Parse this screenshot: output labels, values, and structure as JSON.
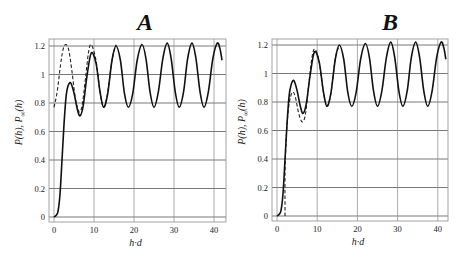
{
  "chart_data": [
    {
      "type": "line",
      "title": "A",
      "xlabel": "h·d",
      "ylabel": "P(h), P∞(h)",
      "ylabel_parts": {
        "p1": "P",
        "s1": "",
        "arg1": "(h)",
        "sep": ",  ",
        "p2": "P",
        "s2": "∞",
        "arg2": "(h)"
      },
      "xlim": [
        -1.2,
        43
      ],
      "ylim": [
        -0.035,
        1.25
      ],
      "xticks": [
        0,
        10,
        20,
        30,
        40
      ],
      "xtick_labels": [
        "0",
        "10",
        "20",
        "30",
        "40"
      ],
      "yticks": [
        0,
        0.2,
        0.4,
        0.6,
        0.8,
        1,
        1.2
      ],
      "ytick_labels": [
        "0",
        "0.2",
        "0.4",
        "0.6",
        "0.8",
        "1",
        "1.2"
      ],
      "grid": true,
      "series": [
        {
          "name": "P(h)",
          "style": "solid",
          "x": [
            0,
            0.5,
            1,
            1.5,
            2,
            2.5,
            3,
            3.5,
            4.2,
            5,
            5.8,
            6.5,
            7.3,
            8.2,
            9.3,
            10.5,
            11.5,
            12.4,
            13.4,
            14.5,
            15.5,
            16.6,
            17.6,
            18.6,
            19.7,
            20.8,
            22,
            23,
            24,
            25,
            26.1,
            27.2,
            28.3,
            29.3,
            30.3,
            31.3,
            32.4,
            33.4,
            34.5,
            35.5,
            36.5,
            37.5,
            38.6,
            39.7,
            40.8,
            41.5,
            42
          ],
          "y": [
            0,
            0.01,
            0.04,
            0.16,
            0.4,
            0.65,
            0.84,
            0.92,
            0.94,
            0.87,
            0.76,
            0.71,
            0.78,
            0.98,
            1.15,
            1.08,
            0.88,
            0.77,
            0.86,
            1.1,
            1.2,
            1.1,
            0.87,
            0.77,
            0.87,
            1.1,
            1.21,
            1.11,
            0.88,
            0.77,
            0.88,
            1.11,
            1.22,
            1.11,
            0.88,
            0.77,
            0.88,
            1.11,
            1.22,
            1.11,
            0.88,
            0.77,
            0.88,
            1.11,
            1.22,
            1.18,
            1.1
          ]
        },
        {
          "name": "P∞(h)",
          "style": "dashed",
          "x": [
            0,
            0.8,
            1.6,
            2.3,
            3,
            3.7,
            4.5,
            5.3,
            6.2,
            7,
            7.9,
            8.6,
            9.3,
            10.5,
            11.5,
            12.4,
            13.4,
            14.5,
            15.5
          ],
          "y": [
            0.77,
            0.88,
            1.06,
            1.18,
            1.21,
            1.17,
            1.02,
            0.84,
            0.74,
            0.78,
            0.98,
            1.15,
            1.21,
            1.1,
            0.88,
            0.77,
            0.87,
            1.1,
            1.21
          ]
        }
      ]
    },
    {
      "type": "line",
      "title": "B",
      "xlabel": "h·d",
      "ylabel": "P(h), P∞(h)",
      "ylabel_parts": {
        "p1": "P",
        "s1": "",
        "arg1": "(h)",
        "sep": ",  ",
        "p2": "P",
        "s2": "∞",
        "arg2": "(h)"
      },
      "xlim": [
        -1.2,
        43
      ],
      "ylim": [
        -0.035,
        1.25
      ],
      "xticks": [
        0,
        10,
        20,
        30,
        40
      ],
      "xtick_labels": [
        "0",
        "10",
        "20",
        "30",
        "40"
      ],
      "yticks": [
        0,
        0.2,
        0.4,
        0.6,
        0.8,
        1,
        1.2
      ],
      "ytick_labels": [
        "0",
        "0.2",
        "0.4",
        "0.6",
        "0.8",
        "1",
        "1.2"
      ],
      "grid": true,
      "series": [
        {
          "name": "P(h)",
          "style": "solid",
          "x": [
            0,
            0.5,
            1,
            1.5,
            2,
            2.5,
            3,
            3.5,
            4.2,
            5,
            5.8,
            6.5,
            7.3,
            8.2,
            9.3,
            10.5,
            11.5,
            12.4,
            13.4,
            14.5,
            15.5,
            16.6,
            17.6,
            18.6,
            19.7,
            20.8,
            22,
            23,
            24,
            25,
            26.1,
            27.2,
            28.3,
            29.3,
            30.3,
            31.3,
            32.4,
            33.4,
            34.5,
            35.5,
            36.5,
            37.5,
            38.6,
            39.7,
            40.8,
            41.5,
            42
          ],
          "y": [
            0,
            0.01,
            0.04,
            0.16,
            0.4,
            0.65,
            0.84,
            0.92,
            0.95,
            0.88,
            0.77,
            0.72,
            0.79,
            0.98,
            1.15,
            1.08,
            0.88,
            0.77,
            0.86,
            1.1,
            1.2,
            1.1,
            0.87,
            0.77,
            0.87,
            1.1,
            1.21,
            1.11,
            0.88,
            0.77,
            0.88,
            1.11,
            1.22,
            1.11,
            0.88,
            0.77,
            0.88,
            1.11,
            1.22,
            1.11,
            0.88,
            0.77,
            0.88,
            1.11,
            1.22,
            1.18,
            1.1
          ]
        },
        {
          "name": "P∞(h)",
          "style": "dashed",
          "x": [
            2.0,
            2.0,
            2.3,
            2.8,
            3.4,
            4.0,
            4.6,
            5.4,
            6.3,
            7.1,
            8.0,
            8.8,
            9.5,
            10.5,
            11.5,
            12.4,
            13.4,
            14.5,
            15.5
          ],
          "y": [
            0,
            0.3,
            0.55,
            0.74,
            0.84,
            0.87,
            0.83,
            0.72,
            0.66,
            0.72,
            0.95,
            1.13,
            1.17,
            1.08,
            0.88,
            0.77,
            0.86,
            1.1,
            1.2
          ]
        }
      ]
    }
  ],
  "layout": {
    "panels": [
      {
        "left": 49,
        "right": 226,
        "top": 39,
        "bottom": 222,
        "x0px": 54,
        "pxPerX": 4.0,
        "y0px": 217,
        "pxPerY": 142.5,
        "titleX": 145,
        "titleY": 30
      },
      {
        "left": 272,
        "right": 448,
        "top": 39,
        "bottom": 221,
        "x0px": 277,
        "pxPerX": 4.02,
        "y0px": 216,
        "pxPerY": 142.5,
        "titleX": 390,
        "titleY": 30
      }
    ]
  }
}
